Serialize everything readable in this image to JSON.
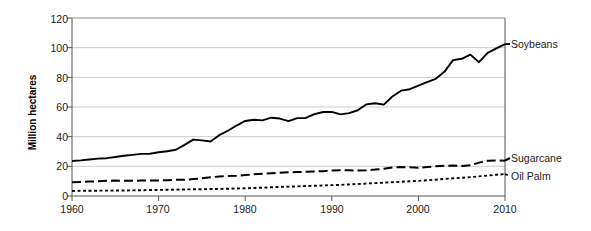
{
  "chart_data": {
    "type": "line",
    "title": "",
    "xlabel": "",
    "ylabel": "Million hectares",
    "xlim": [
      1960,
      2010
    ],
    "ylim": [
      0,
      120
    ],
    "ytick_labels": [
      "0",
      "20",
      "40",
      "60",
      "80",
      "100",
      "120"
    ],
    "yticks": [
      0,
      20,
      40,
      60,
      80,
      100,
      120
    ],
    "xtick_labels": [
      "1960",
      "1970",
      "1980",
      "1990",
      "2000",
      "2010"
    ],
    "xticks": [
      1960,
      1970,
      1980,
      1990,
      2000,
      2010
    ],
    "grid": "horizontal",
    "legend_position": "right-inline",
    "x": [
      1960,
      1961,
      1962,
      1963,
      1964,
      1965,
      1966,
      1967,
      1968,
      1969,
      1970,
      1971,
      1972,
      1973,
      1974,
      1975,
      1976,
      1977,
      1978,
      1979,
      1980,
      1981,
      1982,
      1983,
      1984,
      1985,
      1986,
      1987,
      1988,
      1989,
      1990,
      1991,
      1992,
      1993,
      1994,
      1995,
      1996,
      1997,
      1998,
      1999,
      2000,
      2001,
      2002,
      2003,
      2004,
      2005,
      2006,
      2007,
      2008,
      2009,
      2010
    ],
    "series": [
      {
        "name": "Soybeans",
        "style": "solid",
        "color": "#000000",
        "values": [
          23.6,
          24.0,
          24.6,
          25.2,
          25.5,
          26.3,
          27.1,
          27.7,
          28.4,
          28.5,
          29.5,
          30.2,
          31.2,
          34.5,
          38.0,
          37.5,
          36.7,
          41.0,
          44.0,
          47.5,
          50.6,
          51.4,
          51.0,
          52.8,
          52.2,
          50.5,
          52.5,
          52.6,
          55.2,
          56.6,
          56.7,
          55.0,
          55.9,
          57.8,
          61.8,
          62.5,
          61.6,
          67.1,
          71.0,
          72.0,
          74.4,
          76.8,
          79.0,
          83.7,
          91.6,
          92.5,
          95.3,
          90.2,
          96.5,
          99.5,
          102.4
        ]
      },
      {
        "name": "Sugarcane",
        "style": "dashed",
        "color": "#000000",
        "values": [
          9.2,
          9.4,
          9.7,
          9.9,
          10.2,
          10.4,
          10.3,
          10.3,
          10.4,
          10.5,
          10.5,
          10.6,
          10.9,
          11.0,
          11.4,
          11.9,
          12.6,
          13.2,
          13.4,
          13.6,
          14.1,
          14.6,
          15.0,
          15.4,
          15.7,
          16.0,
          16.1,
          16.3,
          16.6,
          16.7,
          17.2,
          17.4,
          17.3,
          17.2,
          17.4,
          17.8,
          18.4,
          19.2,
          19.5,
          19.3,
          19.0,
          19.6,
          20.0,
          20.4,
          20.5,
          20.3,
          20.7,
          22.5,
          23.8,
          24.0,
          23.8
        ]
      },
      {
        "name": "Oil Palm",
        "style": "dotted",
        "color": "#000000",
        "values": [
          3.4,
          3.5,
          3.5,
          3.6,
          3.6,
          3.7,
          3.7,
          3.8,
          3.9,
          4.0,
          4.1,
          4.2,
          4.3,
          4.4,
          4.5,
          4.6,
          4.7,
          4.8,
          4.9,
          5.1,
          5.2,
          5.4,
          5.6,
          5.9,
          6.1,
          6.3,
          6.5,
          6.7,
          6.9,
          7.1,
          7.3,
          7.5,
          7.8,
          8.1,
          8.4,
          8.7,
          9.0,
          9.3,
          9.6,
          9.9,
          10.2,
          10.6,
          11.0,
          11.5,
          11.9,
          12.3,
          12.7,
          13.2,
          13.8,
          14.3,
          14.8
        ]
      }
    ]
  },
  "axis": {
    "y_title": "Million hectares"
  },
  "labels": {
    "soybeans": "Soybeans",
    "sugarcane": "Sugarcane",
    "oil_palm": "Oil Palm"
  }
}
